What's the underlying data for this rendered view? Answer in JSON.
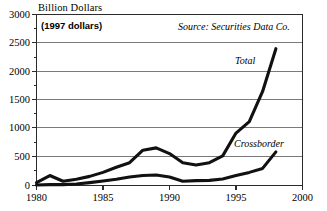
{
  "chart_data": {
    "type": "line",
    "title": "Billion Dollars",
    "xlabel": "",
    "ylabel": "Billion Dollars",
    "ylim": [
      0,
      3000
    ],
    "xlim": [
      1980,
      2000
    ],
    "grid": true,
    "grid_orientation": "horizontal",
    "legend_position": "inline-annotations",
    "y_ticks": [
      0,
      500,
      1000,
      1500,
      2000,
      2500,
      3000
    ],
    "y_tick_labels": [
      "0",
      "500",
      "1000",
      "1500",
      "2000",
      "2500",
      "3000"
    ],
    "y_minor_ticks": [
      250,
      750,
      1250,
      1750,
      2250,
      2750
    ],
    "x_ticks": [
      1980,
      1985,
      1990,
      1995,
      2000
    ],
    "x_tick_labels": [
      "1980",
      "1985",
      "1990",
      "1995",
      "2000"
    ],
    "x": [
      1980,
      1981,
      1982,
      1983,
      1984,
      1985,
      1986,
      1987,
      1988,
      1989,
      1990,
      1991,
      1992,
      1993,
      1994,
      1995,
      1996,
      1997,
      1998
    ],
    "series": [
      {
        "name": "Total",
        "values": [
          50,
          175,
          75,
          110,
          160,
          230,
          320,
          400,
          620,
          660,
          560,
          400,
          360,
          400,
          520,
          920,
          1120,
          1650,
          2400
        ]
      },
      {
        "name": "Crossborder",
        "values": [
          10,
          15,
          15,
          25,
          50,
          80,
          110,
          150,
          175,
          185,
          150,
          75,
          85,
          90,
          115,
          175,
          230,
          300,
          590
        ]
      }
    ],
    "annotations": [
      {
        "name": "deflator-note",
        "text": "(1997 dollars)"
      },
      {
        "name": "source-note",
        "text": "Source: Securities Data Co."
      },
      {
        "name": "total-label",
        "text": "Total"
      },
      {
        "name": "crossborder-label",
        "text": "Crossborder"
      }
    ]
  },
  "axes": {
    "y_title": "Billion Dollars",
    "y_tick_labels": [
      "3000",
      "2500",
      "2000",
      "1500",
      "1000",
      "500",
      "0"
    ],
    "x_tick_labels": [
      "1980",
      "1985",
      "1990",
      "1995",
      "2000"
    ]
  },
  "annotations": {
    "deflator": "(1997 dollars)",
    "source": "Source: Securities Data Co.",
    "total": "Total",
    "crossborder": "Crossborder"
  },
  "colors": {
    "line": "#111111",
    "grid": "#7a7a7a",
    "axis": "#333333",
    "background": "#ffffff"
  }
}
